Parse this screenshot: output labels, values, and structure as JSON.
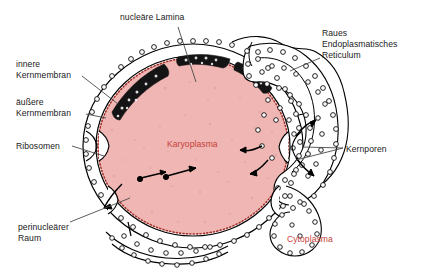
{
  "diagram": {
    "domain": "biology-cell-nucleus-cross-section",
    "background_color": "#ffffff",
    "line_color": "#000000"
  },
  "colors": {
    "karyoplasma_fill": "#efb6b4",
    "karyoplasma_label": "#c8423c",
    "cytoplasma_label": "#c8423c",
    "lamina_dark": "#111111",
    "membrane_stroke": "#000000",
    "leader_line": "#555555",
    "label_text": "#1a1a1a",
    "nuclear_envelope_fill": "#ffffff",
    "lamina_dots": "#b03a34"
  },
  "labels": {
    "nucleaere_lamina": {
      "text": "nucleäre Lamina",
      "x": 120,
      "y": 17
    },
    "raues_er": {
      "line1": "Raues",
      "line2": "Endoplasmatisches",
      "line3": "Reticulum",
      "x": 322,
      "y": 30
    },
    "innere_kernmembran": {
      "line1": "innere",
      "line2": "Kernmembran",
      "x": 16,
      "y": 62
    },
    "aeussere_kernmembran": {
      "line1": "äußere",
      "line2": "Kernmembran",
      "x": 16,
      "y": 100
    },
    "ribosomen": {
      "text": "Ribosomen",
      "x": 16,
      "y": 141
    },
    "perinuclearer_raum": {
      "line1": "perinucleärer",
      "line2": "Raum",
      "x": 18,
      "y": 224
    },
    "karyoplasma": {
      "text": "Karyoplasma",
      "x": 167,
      "y": 139
    },
    "kernporen": {
      "text": "Kernporen",
      "x": 346,
      "y": 145
    },
    "cytoplasma": {
      "text": "Cytoplasma",
      "x": 287,
      "y": 235
    }
  },
  "structures": {
    "nucleus": {
      "name": "Karyoplasma (nucleoplasm)",
      "center_x": 193,
      "center_y": 146,
      "radius_x": 97,
      "radius_y": 90
    },
    "nuclear_envelope": {
      "name": "Kernhülle (nuclear envelope)",
      "membranes": [
        "innere Kernmembran",
        "äußere Kernmembran"
      ],
      "perinuclear_space": "perinukleärer Raum"
    },
    "nuclear_pores_count": 4,
    "ribosome_count": 150,
    "lamina_patches": 3,
    "transport_arrows": 2
  }
}
